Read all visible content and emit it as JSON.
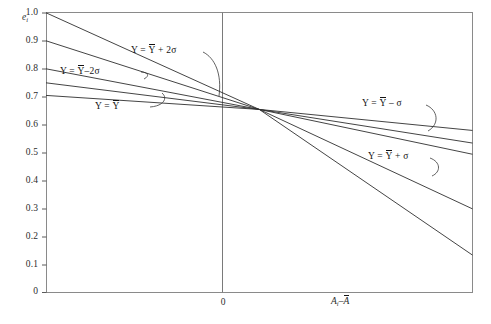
{
  "figure": {
    "type": "line-chart",
    "background": "#ffffff",
    "line_color": "#2f2f2f",
    "frame_color": "#808080"
  },
  "axes": {
    "y_axis_name": "e",
    "y_axis_name_sub": "i",
    "x_axis_name_first": "A",
    "x_axis_name_first_sub": "i",
    "x_axis_name_minus": "–",
    "x_axis_name_second": "A",
    "y_ticks": [
      "1.0",
      "0.9",
      "0.8",
      "0.7",
      "0.6",
      "0.5",
      "0.4",
      "0.3",
      "0.2",
      "0.1",
      "0"
    ],
    "x_ticks": [
      "0"
    ]
  },
  "annotations": {
    "plus_two_sigma": {
      "prefix": "Y = ",
      "bar_symbol": "Y",
      "suffix": " + 2σ"
    },
    "minus_two_sigma": {
      "prefix": "Y = ",
      "bar_symbol": "Y",
      "suffix": "–2σ"
    },
    "mean": {
      "prefix": "Y = ",
      "bar_symbol": "Y",
      "suffix": ""
    },
    "minus_sigma": {
      "prefix": "Y = ",
      "bar_symbol": "Y",
      "suffix": " – σ"
    },
    "plus_sigma": {
      "prefix": "Y = ",
      "bar_symbol": "Y",
      "suffix": " + σ"
    }
  },
  "chart_data": {
    "type": "line",
    "title": "",
    "xlabel": "A_i – Ā",
    "ylabel": "e_i",
    "xlim": [
      -1,
      1
    ],
    "ylim": [
      0,
      1.0
    ],
    "grid": false,
    "legend_position": "inline-annotations",
    "yticks": [
      0,
      0.1,
      0.2,
      0.3,
      0.4,
      0.5,
      0.6,
      0.7,
      0.8,
      0.9,
      1.0
    ],
    "xticks": [
      0
    ],
    "xtick_labels": [
      "0"
    ],
    "convergence_point": {
      "x": 0,
      "y": 0.655
    },
    "series": [
      {
        "name": "Y = Ybar + 2sigma",
        "x": [
          -1,
          0,
          1
        ],
        "values": [
          1.0,
          0.655,
          0.135
        ],
        "note": "steepest descending line, starts at 1.0 on left edge"
      },
      {
        "name": "Y = Ybar + sigma",
        "x": [
          -1,
          0,
          1
        ],
        "values": [
          0.9,
          0.655,
          0.3
        ],
        "note": "second steepest, starts at 0.90 on left edge"
      },
      {
        "name": "Y = Ybar",
        "x": [
          -1,
          0,
          1
        ],
        "values": [
          0.8,
          0.655,
          0.495
        ],
        "note": "middle line, starts at 0.80 on left edge"
      },
      {
        "name": "Y = Ybar - sigma",
        "x": [
          -1,
          0,
          1
        ],
        "values": [
          0.75,
          0.655,
          0.535
        ],
        "note": "starts at 0.75 on left edge"
      },
      {
        "name": "Y = Ybar - 2sigma",
        "x": [
          -1,
          0,
          1
        ],
        "values": [
          0.705,
          0.655,
          0.58
        ],
        "note": "flattest line, starts at 0.705 on left edge"
      }
    ]
  }
}
